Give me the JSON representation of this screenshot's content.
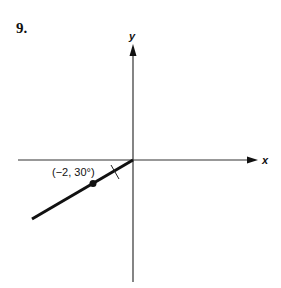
{
  "problem": {
    "number": "9."
  },
  "axes": {
    "x_label": "x",
    "y_label": "y"
  },
  "point": {
    "label": "(−2, 30°)",
    "r": -2,
    "theta_deg": 30
  },
  "colors": {
    "ink": "#111111",
    "axis": "#333333",
    "background": "#ffffff"
  }
}
